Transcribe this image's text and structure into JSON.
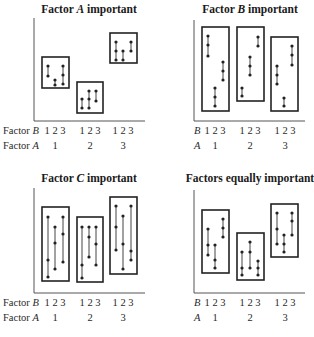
{
  "figure": {
    "panels": [
      {
        "id": "factor-a",
        "title": "Factor A important",
        "title_parts": [
          "Factor ",
          "A",
          " important"
        ],
        "title_x": 89,
        "title_y": 13,
        "axis": {
          "x": 34,
          "y_top": 18,
          "y_bottom": 121,
          "x_right": 145
        },
        "row_b_label": [
          "Factor ",
          "B"
        ],
        "row_a_label": [
          "Factor ",
          "A"
        ],
        "row_b_y": 134,
        "row_a_y": 149,
        "label_x": 3,
        "b_ticks": "1 2 3",
        "a_values": [
          "1",
          "2",
          "3"
        ],
        "group_centers": [
          55,
          90,
          123
        ],
        "boxes": [
          {
            "x": 42,
            "y": 57,
            "w": 27,
            "h": 31,
            "bars": [
              {
                "x": 48,
                "pts": [
                  66,
                  76
                ]
              },
              {
                "x": 55,
                "pts": [
                  80,
                  85
                ]
              },
              {
                "x": 63,
                "pts": [
                  66,
                  75,
                  84
                ]
              }
            ]
          },
          {
            "x": 77,
            "y": 82,
            "w": 26,
            "h": 31,
            "bars": [
              {
                "x": 82,
                "pts": [
                  99,
                  108
                ]
              },
              {
                "x": 89,
                "pts": [
                  91,
                  99,
                  108
                ]
              },
              {
                "x": 96,
                "pts": [
                  91,
                  101
                ]
              }
            ]
          },
          {
            "x": 110,
            "y": 33,
            "w": 27,
            "h": 30,
            "bars": [
              {
                "x": 116,
                "pts": [
                  42,
                  51,
                  60
                ]
              },
              {
                "x": 123,
                "pts": [
                  51,
                  60
                ]
              },
              {
                "x": 131,
                "pts": [
                  42,
                  51
                ]
              }
            ]
          }
        ]
      },
      {
        "id": "factor-b",
        "title": "Factor B important",
        "title_parts": [
          "Factor ",
          "B",
          " important"
        ],
        "title_x": 250,
        "title_y": 13,
        "axis": {
          "x": 194,
          "y_top": 20,
          "y_bottom": 121,
          "x_right": 305
        },
        "row_b_label": [
          "",
          "B"
        ],
        "row_a_label": [
          "",
          "A"
        ],
        "row_b_y": 134,
        "row_a_y": 149,
        "label_x": 194,
        "b_ticks": "1 2 3",
        "a_values": [
          "1",
          "2",
          "3"
        ],
        "group_centers": [
          215,
          250,
          285
        ],
        "boxes": [
          {
            "x": 202,
            "y": 27,
            "w": 27,
            "h": 84,
            "bars": [
              {
                "x": 208,
                "pts": [
                  36,
                  45,
                  56
                ]
              },
              {
                "x": 215,
                "pts": [
                  88,
                  97,
                  106
                ]
              },
              {
                "x": 223,
                "pts": [
                  62,
                  71,
                  80
                ]
              }
            ]
          },
          {
            "x": 237,
            "y": 27,
            "w": 27,
            "h": 74,
            "bars": [
              {
                "x": 242,
                "pts": [
                  88,
                  96
                ]
              },
              {
                "x": 250,
                "pts": [
                  57,
                  66,
                  75
                ]
              },
              {
                "x": 258,
                "pts": [
                  37,
                  46
                ]
              }
            ]
          },
          {
            "x": 271,
            "y": 37,
            "w": 27,
            "h": 74,
            "bars": [
              {
                "x": 277,
                "pts": [
                  66,
                  75,
                  84
                ]
              },
              {
                "x": 284,
                "pts": [
                  98,
                  106
                ]
              },
              {
                "x": 292,
                "pts": [
                  46,
                  55,
                  65
                ]
              }
            ]
          }
        ]
      },
      {
        "id": "factor-c",
        "title": "Factor C important",
        "title_parts": [
          "Factor ",
          "C",
          " important"
        ],
        "title_x": 89,
        "title_y": 182,
        "axis": {
          "x": 34,
          "y_top": 188,
          "y_bottom": 293,
          "x_right": 145
        },
        "row_b_label": [
          "Factor ",
          "B"
        ],
        "row_a_label": [
          "Factor ",
          "A"
        ],
        "row_b_y": 306,
        "row_a_y": 321,
        "label_x": 3,
        "b_ticks": "1 2 3",
        "a_values": [
          "1",
          "2",
          "3"
        ],
        "group_centers": [
          55,
          90,
          123
        ],
        "boxes": [
          {
            "x": 42,
            "y": 207,
            "w": 27,
            "h": 74,
            "bars": [
              {
                "x": 48,
                "pts": [
                  217,
                  260,
                  277
                ]
              },
              {
                "x": 55,
                "pts": [
                  227,
                  243,
                  269
                ]
              },
              {
                "x": 63,
                "pts": [
                  217,
                  234,
                  262
                ]
              }
            ]
          },
          {
            "x": 77,
            "y": 217,
            "w": 26,
            "h": 65,
            "bars": [
              {
                "x": 82,
                "pts": [
                  227,
                  265,
                  278
                ]
              },
              {
                "x": 89,
                "pts": [
                  227,
                  237,
                  257
                ]
              },
              {
                "x": 96,
                "pts": [
                  227,
                  244,
                  265
                ]
              }
            ]
          },
          {
            "x": 110,
            "y": 197,
            "w": 27,
            "h": 77,
            "bars": [
              {
                "x": 116,
                "pts": [
                  206,
                  227,
                  250
                ]
              },
              {
                "x": 123,
                "pts": [
                  216,
                  244,
                  269
                ]
              },
              {
                "x": 131,
                "pts": [
                  206,
                  251,
                  260
                ]
              }
            ]
          }
        ]
      },
      {
        "id": "equal",
        "title": "Factors equally important",
        "title_parts": [
          "Factors equally important",
          "",
          ""
        ],
        "title_x": 250,
        "title_y": 182,
        "axis": {
          "x": 194,
          "y_top": 190,
          "y_bottom": 293,
          "x_right": 305
        },
        "row_b_label": [
          "",
          "B"
        ],
        "row_a_label": [
          "",
          "A"
        ],
        "row_b_y": 306,
        "row_a_y": 321,
        "label_x": 194,
        "b_ticks": "1 2 3",
        "a_values": [
          "1",
          "2",
          "3"
        ],
        "group_centers": [
          215,
          250,
          285
        ],
        "boxes": [
          {
            "x": 202,
            "y": 210,
            "w": 27,
            "h": 63,
            "bars": [
              {
                "x": 208,
                "pts": [
                  229,
                  245,
                  255
                ]
              },
              {
                "x": 215,
                "pts": [
                  245,
                  260,
                  268
                ]
              },
              {
                "x": 223,
                "pts": [
                  219,
                  228,
                  237
                ]
              }
            ]
          },
          {
            "x": 237,
            "y": 233,
            "w": 27,
            "h": 47,
            "bars": [
              {
                "x": 242,
                "pts": [
                  252,
                  268,
                  275
                ]
              },
              {
                "x": 250,
                "pts": [
                  242,
                  252,
                  268
                ]
              },
              {
                "x": 258,
                "pts": [
                  261,
                  268,
                  275
                ]
              }
            ]
          },
          {
            "x": 271,
            "y": 204,
            "w": 27,
            "h": 53,
            "bars": [
              {
                "x": 277,
                "pts": [
                  213,
                  229,
                  244
                ]
              },
              {
                "x": 284,
                "pts": [
                  235,
                  244,
                  252
                ]
              },
              {
                "x": 292,
                "pts": [
                  213,
                  221,
                  235
                ]
              }
            ]
          }
        ]
      }
    ]
  },
  "chart_data": [
    {
      "type": "diagram",
      "title": "Factor A important",
      "xlabel": [
        "Factor B",
        "Factor A"
      ],
      "groups": [
        {
          "A": 1,
          "B_ticks": [
            "1",
            "2",
            "3"
          ]
        },
        {
          "A": 2,
          "B_ticks": [
            "1",
            "2",
            "3"
          ]
        },
        {
          "A": 3,
          "B_ticks": [
            "1",
            "2",
            "3"
          ]
        }
      ],
      "note": "Groups (boxes) differ in level strongly by A; spread within boxes small"
    },
    {
      "type": "diagram",
      "title": "Factor B important",
      "xlabel": [
        "B",
        "A"
      ],
      "note": "Tall boxes; within-box B level differences large; boxes at similar levels"
    },
    {
      "type": "diagram",
      "title": "Factor C important",
      "xlabel": [
        "Factor B",
        "Factor A"
      ],
      "note": "Long vertical lines (C replicates) dominate variation"
    },
    {
      "type": "diagram",
      "title": "Factors equally important",
      "xlabel": [
        "B",
        "A"
      ],
      "note": "Variation split evenly among A, B, and C"
    }
  ]
}
